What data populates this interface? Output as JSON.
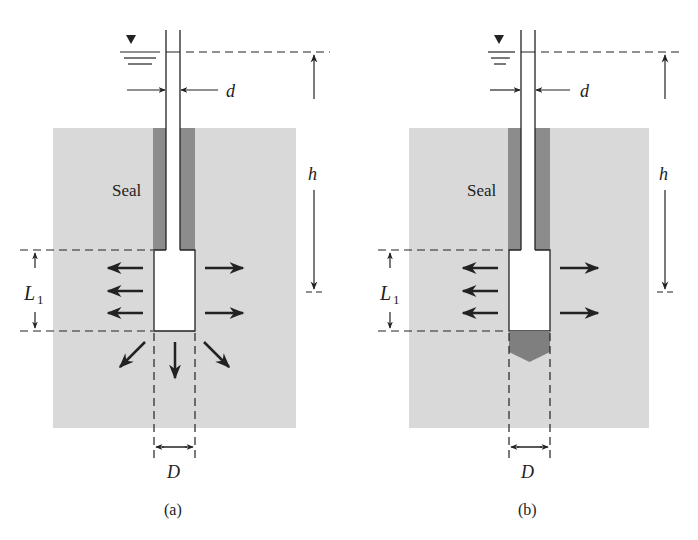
{
  "colors": {
    "soil": "#d9d9d9",
    "seal": "#8c8c8c",
    "plug": "#7f7f7f",
    "line": "#222222",
    "background": "#ffffff"
  },
  "panels": [
    {
      "id": "a",
      "caption": "(a)",
      "seal_label": "Seal",
      "dim_h": "h",
      "dim_d": "d",
      "dim_L": "L",
      "dim_L_sub": "1",
      "dim_D": "D",
      "bottom": "open",
      "flow_arrows": {
        "left": 3,
        "right": 2,
        "bottom": 3
      }
    },
    {
      "id": "b",
      "caption": "(b)",
      "seal_label": "Seal",
      "dim_h": "h",
      "dim_d": "d",
      "dim_L": "L",
      "dim_L_sub": "1",
      "dim_D": "D",
      "bottom": "sealed-plug",
      "flow_arrows": {
        "left": 3,
        "right": 2,
        "bottom": 0
      }
    }
  ]
}
